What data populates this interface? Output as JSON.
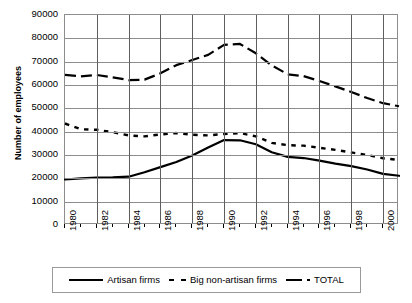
{
  "chart_data": {
    "type": "line",
    "title": "",
    "xlabel": "",
    "ylabel": "Number of employees",
    "xlim": [
      1980,
      2001
    ],
    "ylim": [
      0,
      90000
    ],
    "grid": true,
    "legend_position": "bottom",
    "x": [
      1980,
      1981,
      1982,
      1983,
      1984,
      1985,
      1986,
      1987,
      1988,
      1989,
      1990,
      1991,
      1992,
      1993,
      1994,
      1995,
      1996,
      1997,
      1998,
      1999,
      2000,
      2001
    ],
    "xtick_labels": [
      "1980",
      "1982",
      "1984",
      "1986",
      "1988",
      "1990",
      "1992",
      "1994",
      "1996",
      "1998",
      "2000"
    ],
    "ytick_labels": [
      "0",
      "10000",
      "20000",
      "30000",
      "40000",
      "50000",
      "60000",
      "70000",
      "80000",
      "90000"
    ],
    "ytick_values": [
      0,
      10000,
      20000,
      30000,
      40000,
      50000,
      60000,
      70000,
      80000,
      90000
    ],
    "series": [
      {
        "name": "Artisan firms",
        "style": "solid",
        "values": [
          19500,
          20000,
          20300,
          20400,
          20700,
          22600,
          24800,
          27000,
          29800,
          33200,
          36400,
          36300,
          34600,
          31200,
          29200,
          28700,
          27600,
          26300,
          25200,
          23800,
          21900,
          21100
        ]
      },
      {
        "name": "Big non-artisan firms",
        "style": "dotted",
        "values": [
          43500,
          41000,
          40800,
          39800,
          38400,
          38000,
          38800,
          39400,
          38700,
          38400,
          39000,
          39400,
          38000,
          35200,
          34200,
          34000,
          33100,
          32200,
          31100,
          30000,
          28600,
          27900
        ]
      },
      {
        "name": "TOTAL",
        "style": "dashed",
        "values": [
          64300,
          63700,
          64300,
          63300,
          62100,
          62300,
          65000,
          68500,
          70700,
          72900,
          77200,
          77600,
          73600,
          68400,
          64600,
          63800,
          61700,
          59400,
          57000,
          54400,
          52200,
          50900
        ]
      }
    ]
  },
  "legend": {
    "items": [
      {
        "label": "Artisan firms",
        "style": "solid"
      },
      {
        "label": "Big non-artisan firms",
        "style": "dotted"
      },
      {
        "label": "TOTAL",
        "style": "dashed"
      }
    ]
  },
  "colors": {
    "series_line": "#000000",
    "grid_major": "#8d8d8d",
    "grid_vertical": "#5e5e5e",
    "background": "#ffffff"
  }
}
